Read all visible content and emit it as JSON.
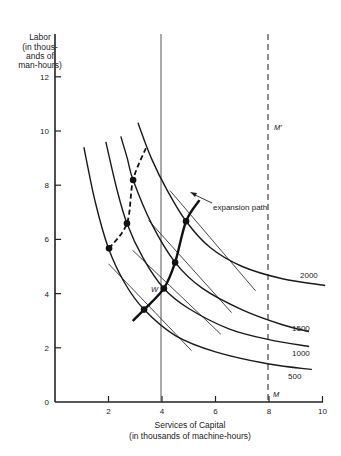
{
  "chart_data": {
    "type": "line",
    "title": "",
    "ylabel_lines": [
      "Labor",
      "(in thous-",
      "ands of",
      "man-hours)"
    ],
    "xlabel_lines": [
      "Services of Capital",
      "(in thousands of machine-hours)"
    ],
    "xlim": [
      0,
      10
    ],
    "ylim": [
      0,
      13
    ],
    "xticks": [
      2,
      4,
      6,
      8,
      10
    ],
    "yticks": [
      2,
      4,
      6,
      8,
      10,
      12
    ],
    "origin_label": "0",
    "grid": false,
    "isoquants": [
      {
        "name": "500",
        "points": [
          [
            1.08,
            9.4
          ],
          [
            1.5,
            7.4
          ],
          [
            2.0,
            5.67
          ],
          [
            2.6,
            4.4
          ],
          [
            3.33,
            3.41
          ],
          [
            4.5,
            2.45
          ],
          [
            6.0,
            1.85
          ],
          [
            8.0,
            1.4
          ],
          [
            9.6,
            1.2
          ]
        ]
      },
      {
        "name": "1000",
        "points": [
          [
            1.9,
            9.6
          ],
          [
            2.3,
            7.9
          ],
          [
            2.69,
            6.59
          ],
          [
            3.3,
            5.3
          ],
          [
            4.07,
            4.19
          ],
          [
            5.0,
            3.45
          ],
          [
            6.5,
            2.7
          ],
          [
            8.0,
            2.3
          ],
          [
            9.5,
            2.05
          ]
        ]
      },
      {
        "name": "1500",
        "points": [
          [
            2.46,
            9.8
          ],
          [
            2.7,
            9.0
          ],
          [
            2.92,
            8.19
          ],
          [
            3.6,
            6.6
          ],
          [
            4.49,
            5.15
          ],
          [
            5.5,
            4.2
          ],
          [
            7.0,
            3.4
          ],
          [
            8.5,
            2.85
          ],
          [
            9.5,
            2.6
          ]
        ]
      },
      {
        "name": "2000",
        "points": [
          [
            3.1,
            10.3
          ],
          [
            3.6,
            9.0
          ],
          [
            4.2,
            7.8
          ],
          [
            4.9,
            6.67
          ],
          [
            5.8,
            5.7
          ],
          [
            7.0,
            5.0
          ],
          [
            8.5,
            4.55
          ],
          [
            10.1,
            4.3
          ]
        ]
      }
    ],
    "tangent_lines": [
      {
        "from": [
          2.0,
          5.1
        ],
        "to": [
          5.1,
          1.9
        ]
      },
      {
        "from": [
          2.9,
          5.6
        ],
        "to": [
          6.2,
          2.5
        ]
      },
      {
        "from": [
          3.5,
          6.7
        ],
        "to": [
          6.6,
          3.3
        ]
      },
      {
        "from": [
          4.3,
          7.8
        ],
        "to": [
          7.5,
          4.1
        ]
      }
    ],
    "expansion_path": {
      "label": "expansion path",
      "points": [
        [
          2.9,
          2.99
        ],
        [
          3.33,
          3.41
        ],
        [
          4.07,
          4.19
        ],
        [
          4.49,
          5.15
        ],
        [
          4.9,
          6.67
        ],
        [
          5.4,
          7.45
        ]
      ]
    },
    "short_run_path": {
      "style": "dashed",
      "points": [
        [
          2.02,
          5.67
        ],
        [
          2.69,
          6.59
        ],
        [
          2.92,
          8.19
        ],
        [
          3.4,
          9.37
        ]
      ]
    },
    "equilibrium_points": [
      [
        3.33,
        3.41
      ],
      [
        4.07,
        4.19
      ],
      [
        4.49,
        5.15
      ],
      [
        4.9,
        6.67
      ],
      [
        2.02,
        5.67
      ],
      [
        2.69,
        6.59
      ],
      [
        2.92,
        8.19
      ]
    ],
    "vertical_lines": [
      {
        "x": 4,
        "style": "solid",
        "label": ""
      },
      {
        "x": 8,
        "style": "dashed",
        "label_top": "M′",
        "label_bottom": "M"
      }
    ],
    "point_label": "W",
    "isoquant_labels": [
      "2000",
      "1500",
      "1000",
      "500"
    ]
  }
}
